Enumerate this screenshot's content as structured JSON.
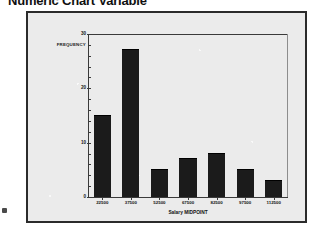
{
  "page": {
    "title": "Numeric Chart Variable",
    "background_color": "#ffffff",
    "corner_marker_name": "page-corner-marker"
  },
  "panel": {
    "background_color": "#ebebeb",
    "border_color": "#2b2b2b"
  },
  "chart_data": {
    "type": "bar",
    "title": "Numeric Chart Variable",
    "subtitle": "",
    "xlabel": "Salary MIDPOINT",
    "ylabel": "FREQUENCY",
    "categories": [
      "22500",
      "37500",
      "52500",
      "67500",
      "82500",
      "97500",
      "112500"
    ],
    "values": [
      15,
      27,
      5,
      7,
      8,
      5,
      3
    ],
    "series": [
      {
        "name": "FREQUENCY",
        "values": [
          15,
          27,
          5,
          7,
          8,
          5,
          3
        ],
        "color": "#1b1b1b"
      }
    ],
    "ylim": [
      0,
      30
    ],
    "y_ticks": [
      0,
      10,
      20,
      30
    ],
    "y_tick_labels": [
      "0",
      "10",
      "20",
      "30"
    ],
    "y_minor_tick_step": 2,
    "xlim_categories": 7,
    "grid": false,
    "legend": false,
    "legend_position": "none",
    "bar_color": "#1b1b1b",
    "axis_color": "#3a3a3a"
  }
}
